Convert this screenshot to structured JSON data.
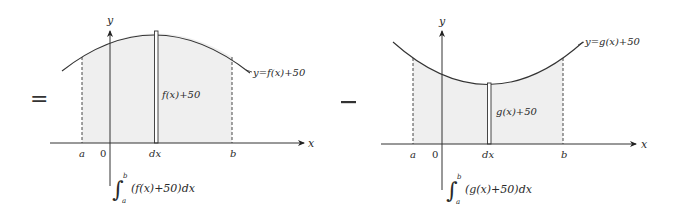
{
  "operators": {
    "equals": "=",
    "minus": "−"
  },
  "left_panel": {
    "axis_x_label": "x",
    "axis_y_label": "y",
    "tick_a": "a",
    "tick_origin": "0",
    "tick_dx": "dx",
    "tick_b": "b",
    "curve_label": "y=f(x)+50",
    "strip_label": "f(x)+50",
    "integral_upper": "b",
    "integral_lower": "a",
    "integral_body": "(f(x)+50)dx",
    "shading_color": "#efefef",
    "curve_shape": "concave-down (arch)"
  },
  "right_panel": {
    "axis_x_label": "x",
    "axis_y_label": "y",
    "tick_a": "a",
    "tick_origin": "0",
    "tick_dx": "dx",
    "tick_b": "b",
    "curve_label": "y=g(x)+50",
    "strip_label": "g(x)+50",
    "integral_upper": "b",
    "integral_lower": "a",
    "integral_body": "(g(x)+50)dx",
    "shading_color": "#efefef",
    "curve_shape": "concave-up (valley)"
  }
}
